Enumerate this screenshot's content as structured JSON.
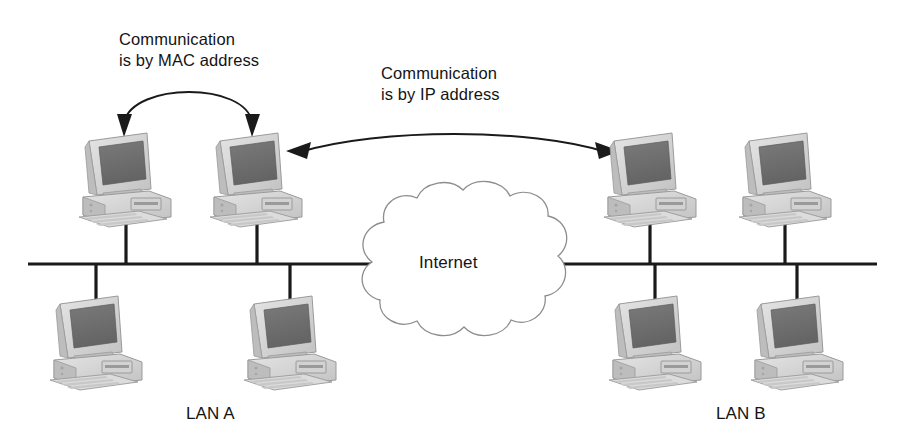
{
  "diagram": {
    "background": "#ffffff",
    "line_color": "#1a1a1a"
  },
  "labels": {
    "mac": "Communication\nis by MAC address",
    "ip": "Communication\nis by IP address",
    "internet": "Internet",
    "lan_a": "LAN A",
    "lan_b": "LAN B"
  },
  "annotations": [
    {
      "id": "mac-arrow",
      "name": "mac-communication-arrow",
      "text": "Communication is by MAC address",
      "style": "curved double-headed arrow",
      "from": "lan-a-host-1",
      "to": "lan-a-host-2"
    },
    {
      "id": "ip-arrow",
      "name": "ip-communication-arrow",
      "text": "Communication is by IP address",
      "style": "curved double-headed arrow",
      "from": "lan-a-host-2",
      "to": "lan-b-host-1"
    }
  ],
  "network": {
    "backbone": {
      "y": 264,
      "x_start": 28,
      "x_end": 877,
      "thickness": 3
    },
    "cloud": {
      "label": "Internet",
      "x": 363,
      "y": 198,
      "width": 197,
      "height": 130
    },
    "segments": [
      {
        "name": "LAN A",
        "label": "LAN A"
      },
      {
        "name": "LAN B",
        "label": "LAN B"
      }
    ],
    "hosts": [
      {
        "id": "lan-a-host-1",
        "segment": "LAN A",
        "position": "top",
        "x": 75,
        "y": 127,
        "stem_x": 126
      },
      {
        "id": "lan-a-host-2",
        "segment": "LAN A",
        "position": "top",
        "x": 206,
        "y": 127,
        "stem_x": 257
      },
      {
        "id": "lan-a-host-3",
        "segment": "LAN A",
        "position": "bottom",
        "x": 46,
        "y": 290,
        "stem_x": 96
      },
      {
        "id": "lan-a-host-4",
        "segment": "LAN A",
        "position": "bottom",
        "x": 240,
        "y": 290,
        "stem_x": 290
      },
      {
        "id": "lan-b-host-1",
        "segment": "LAN B",
        "position": "top",
        "x": 600,
        "y": 127,
        "stem_x": 650
      },
      {
        "id": "lan-b-host-2",
        "segment": "LAN B",
        "position": "top",
        "x": 735,
        "y": 127,
        "stem_x": 785
      },
      {
        "id": "lan-b-host-3",
        "segment": "LAN B",
        "position": "bottom",
        "x": 605,
        "y": 290,
        "stem_x": 655
      },
      {
        "id": "lan-b-host-4",
        "segment": "LAN B",
        "position": "bottom",
        "x": 747,
        "y": 290,
        "stem_x": 797
      }
    ]
  },
  "colors": {
    "screen_dark": "#6e6e6e",
    "case_light": "#d6d6d6",
    "case_mid": "#bdbdbd",
    "outline": "#9a9a9a",
    "line": "#1a1a1a",
    "text": "#141414"
  }
}
